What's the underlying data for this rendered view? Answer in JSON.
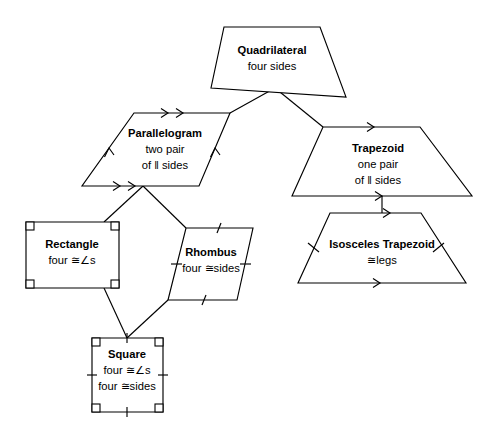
{
  "diagram": {
    "background_color": "#ffffff",
    "stroke_color": "#000000",
    "nodes": {
      "quadrilateral": {
        "name": "Quadrilateral",
        "line1": "four sides",
        "line2": "",
        "shape": "trapezoid-irregular",
        "points": "224,27 320,27 346,97 211,88",
        "title_x": 272,
        "title_y": 54,
        "sub1_x": 272,
        "sub1_y": 70,
        "sub2_x": 272,
        "sub2_y": 86,
        "marks": []
      },
      "parallelogram": {
        "name": "Parallelogram",
        "line1": "two pair",
        "line2": "of ‖ sides",
        "shape": "parallelogram",
        "points": "134,113 230,113 199,186 82,186",
        "title_x": 165,
        "title_y": 137,
        "sub1_x": 165,
        "sub1_y": 153,
        "sub2_x": 165,
        "sub2_y": 169,
        "marks": [
          "double-arrow-top",
          "double-arrow-bottom",
          "arrow-left",
          "arrow-right"
        ]
      },
      "trapezoid": {
        "name": "Trapezoid",
        "line1": "one pair",
        "line2": "of ‖ sides",
        "shape": "trapezoid",
        "points": "323,127 420,127 472,196 292,196",
        "title_x": 378,
        "title_y": 152,
        "sub1_x": 378,
        "sub1_y": 168,
        "sub2_x": 378,
        "sub2_y": 184,
        "marks": [
          "arrow-top",
          "arrow-bottom"
        ]
      },
      "rectangle": {
        "name": "Rectangle",
        "line1": "four ≅∠s",
        "line2": "",
        "shape": "rectangle",
        "points": "26,222 119,222 119,288 26,288",
        "title_x": 72,
        "title_y": 248,
        "sub1_x": 72,
        "sub1_y": 264,
        "sub2_x": 72,
        "sub2_y": 280,
        "marks": [
          "right-angle-corners"
        ]
      },
      "rhombus": {
        "name": "Rhombus",
        "line1": "four ≅sides",
        "line2": "",
        "shape": "rhombus",
        "points": "186,228 253,228 237,300 168,300",
        "title_x": 211,
        "title_y": 256,
        "sub1_x": 211,
        "sub1_y": 272,
        "sub2_x": 211,
        "sub2_y": 288,
        "marks": [
          "tick-all-sides"
        ]
      },
      "square": {
        "name": "Square",
        "line1": "four ≅∠s",
        "line2": "four ≅sides",
        "shape": "square",
        "points": "92,338 163,338 163,412 92,412",
        "title_x": 127,
        "title_y": 358,
        "sub1_x": 127,
        "sub1_y": 374,
        "sub2_x": 127,
        "sub2_y": 390,
        "marks": [
          "right-angle-corners",
          "tick-all-sides"
        ]
      },
      "isosceles_trapezoid": {
        "name": "Isosceles Trapezoid",
        "line1": "≅legs",
        "line2": "",
        "shape": "trapezoid",
        "points": "330,213 421,213 466,283 298,283",
        "title_x": 382,
        "title_y": 248,
        "sub1_x": 382,
        "sub1_y": 264,
        "sub2_x": 382,
        "sub2_y": 280,
        "marks": [
          "arrow-top",
          "arrow-bottom",
          "tick-legs"
        ]
      }
    },
    "connectors": [
      {
        "id": "quad-to-parallelogram",
        "from": "quadrilateral",
        "to": "parallelogram",
        "path": "M 275,88 L 230,113"
      },
      {
        "id": "quad-to-trapezoid",
        "from": "quadrilateral",
        "to": "trapezoid",
        "path": "M 275,88 L 323,127"
      },
      {
        "id": "parallelogram-to-rectangle",
        "from": "parallelogram",
        "to": "rectangle",
        "path": "M 143,186 L 104,222"
      },
      {
        "id": "parallelogram-to-rhombus",
        "from": "parallelogram",
        "to": "rhombus",
        "path": "M 143,186 L 186,228"
      },
      {
        "id": "rectangle-to-square",
        "from": "rectangle",
        "to": "square",
        "path": "M 104,288 L 127,338"
      },
      {
        "id": "rhombus-to-square",
        "from": "rhombus",
        "to": "square",
        "path": "M 168,300 L 127,338"
      },
      {
        "id": "trapezoid-to-isosceles",
        "from": "trapezoid",
        "to": "isosceles_trapezoid",
        "path": "M 382,196 L 382,213"
      }
    ]
  }
}
